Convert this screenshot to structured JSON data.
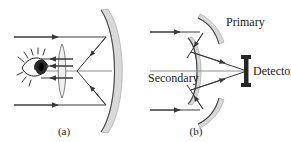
{
  "figure": {
    "background_color": "#ffffff",
    "ink_color": "#3a3a3a",
    "mirror_fill_color": "#d9d9d9",
    "width": 291,
    "height": 142,
    "panels": [
      {
        "id": "a",
        "caption": "(a)",
        "description": "Refracting eyepiece telescope: parallel rays reflect from a concave primary mirror, converge through a lens, and enter the eye",
        "labels": [],
        "elements": {
          "primary_mirror_name": "concave-primary-mirror",
          "lens_name": "eyepiece-lens",
          "eye_name": "observer-eye",
          "incoming_ray_count": 2,
          "reflected_ray_count": 2,
          "exit_ray_count": 2
        }
      },
      {
        "id": "b",
        "caption": "(b)",
        "description": "Cassegrain reflector: parallel rays reflect from primary mirror segments to a convex secondary mirror and converge on the detector",
        "labels": [
          {
            "key": "primary",
            "text": "Primary"
          },
          {
            "key": "secondary",
            "text": "Secondary"
          },
          {
            "key": "detector",
            "text": "Detector"
          }
        ],
        "elements": {
          "primary_mirror_name": "primary-mirror-segments",
          "secondary_mirror_name": "convex-secondary-mirror",
          "detector_name": "detector-bar",
          "incoming_ray_count": 2,
          "reflected_ray_count": 4
        }
      }
    ]
  },
  "labels": {
    "primary": "Primary",
    "secondary": "Secondary",
    "detector": "Detector"
  },
  "captions": {
    "panel_a": "(a)",
    "panel_b": "(b)"
  }
}
